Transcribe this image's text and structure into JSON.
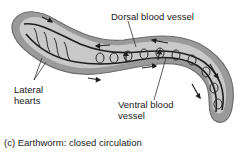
{
  "figure": {
    "caption": "(c) Earthworm: closed circulation",
    "labels": {
      "dorsal": "Dorsal blood vessel",
      "lateral_line1": "Lateral",
      "lateral_line2": "hearts",
      "ventral_line1": "Ventral blood",
      "ventral_line2": "vessel"
    },
    "colors": {
      "body_outer": "#9a9a9a",
      "body_inner": "#c9c9c9",
      "vessel": "#1e1e1e",
      "text": "#222222"
    }
  }
}
